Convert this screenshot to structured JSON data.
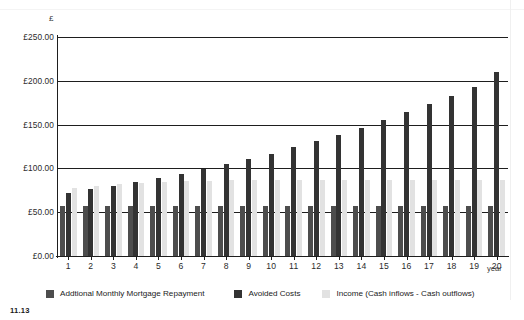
{
  "figure": {
    "number": "11.13",
    "axis_unit_label": "£",
    "x_axis_title": "year"
  },
  "legend": {
    "items": [
      {
        "label": "Addtional Monthly Mortgage Repayment",
        "color": "#4d4d4d",
        "icon": "legend-swatch-icon"
      },
      {
        "label": "Avoided Costs",
        "color": "#333333",
        "icon": "legend-swatch-icon"
      },
      {
        "label": "Income (Cash inflows - Cash outflows)",
        "color": "#e2e2e2",
        "icon": "legend-swatch-icon"
      }
    ]
  },
  "chart_data": {
    "type": "bar",
    "title": "",
    "xlabel": "year",
    "ylabel": "£",
    "ylim": [
      0,
      250
    ],
    "ytick_values": [
      0,
      50,
      100,
      150,
      200,
      250
    ],
    "ytick_labels": [
      "£0.00",
      "£50.00",
      "£100.00",
      "£150.00",
      "£200.00",
      "£250.00"
    ],
    "grid": true,
    "legend_position": "bottom",
    "categories": [
      "1",
      "2",
      "3",
      "4",
      "5",
      "6",
      "7",
      "8",
      "9",
      "10",
      "11",
      "12",
      "13",
      "14",
      "15",
      "16",
      "17",
      "18",
      "19",
      "20"
    ],
    "series": [
      {
        "name": "Addtional Monthly Mortgage Repayment",
        "color": "#4d4d4d",
        "values": [
          57,
          57,
          57,
          57,
          57,
          57,
          57,
          57,
          57,
          57,
          57,
          57,
          57,
          57,
          57,
          57,
          57,
          57,
          57,
          57
        ]
      },
      {
        "name": "Avoided Costs",
        "color": "#333333",
        "values": [
          72,
          76,
          80,
          84,
          89,
          94,
          99,
          105,
          111,
          117,
          124,
          131,
          138,
          146,
          155,
          164,
          173,
          183,
          193,
          210
        ]
      },
      {
        "name": "Income (Cash inflows - Cash outflows)",
        "color": "#e2e2e2",
        "values": [
          78,
          80,
          82,
          83,
          85,
          86,
          86,
          87,
          87,
          87,
          87,
          87,
          87,
          87,
          87,
          87,
          87,
          87,
          87,
          87
        ]
      }
    ]
  }
}
